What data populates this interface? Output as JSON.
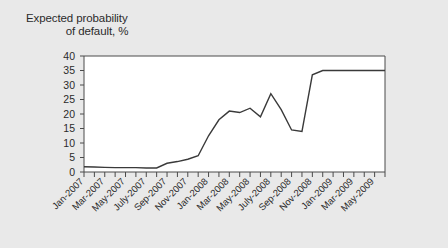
{
  "figure": {
    "background_color": "#e9e9e9",
    "plot_background_color": "#ffffff",
    "axis_color": "#4a4a4a",
    "line_color": "#3a3a3a"
  },
  "title": {
    "line1": "Expected probability",
    "line2": "of default, %"
  },
  "chart_data": {
    "type": "line",
    "title": "Expected probability of default, %",
    "xlabel": "",
    "ylabel": "Expected probability of default, %",
    "ylim": [
      0,
      40
    ],
    "yticks": [
      0,
      5,
      10,
      15,
      20,
      25,
      30,
      35,
      40
    ],
    "grid": false,
    "legend": "none",
    "x_tick_labels": [
      "Jan-2007",
      "Mar-2007",
      "May-2007",
      "July-2007",
      "Sep-2007",
      "Nov-2007",
      "Jan-2008",
      "Mar-2008",
      "May-2008",
      "July-2008",
      "Sep-2008",
      "Nov-2008",
      "Jan-2009",
      "Mar-2009",
      "May-2009"
    ],
    "x": [
      "Jan-2007",
      "Feb-2007",
      "Mar-2007",
      "Apr-2007",
      "May-2007",
      "Jun-2007",
      "Jul-2007",
      "Aug-2007",
      "Sep-2007",
      "Oct-2007",
      "Nov-2007",
      "Dec-2007",
      "Jan-2008",
      "Feb-2008",
      "Mar-2008",
      "Apr-2008",
      "May-2008",
      "Jun-2008",
      "Jul-2008",
      "Aug-2008",
      "Sep-2008",
      "Oct-2008",
      "Nov-2008",
      "Dec-2008",
      "Jan-2009",
      "Feb-2009",
      "Mar-2009",
      "Apr-2009",
      "May-2009",
      "Jun-2009"
    ],
    "values": [
      1.8,
      1.7,
      1.6,
      1.5,
      1.5,
      1.5,
      1.4,
      1.4,
      3.0,
      3.6,
      4.4,
      5.6,
      12.5,
      18.0,
      21.0,
      20.5,
      22.0,
      19.0,
      27.0,
      21.5,
      14.5,
      14.0,
      33.5,
      35.0,
      35.0,
      35.0,
      35.0,
      35.0,
      35.0,
      35.0
    ]
  }
}
